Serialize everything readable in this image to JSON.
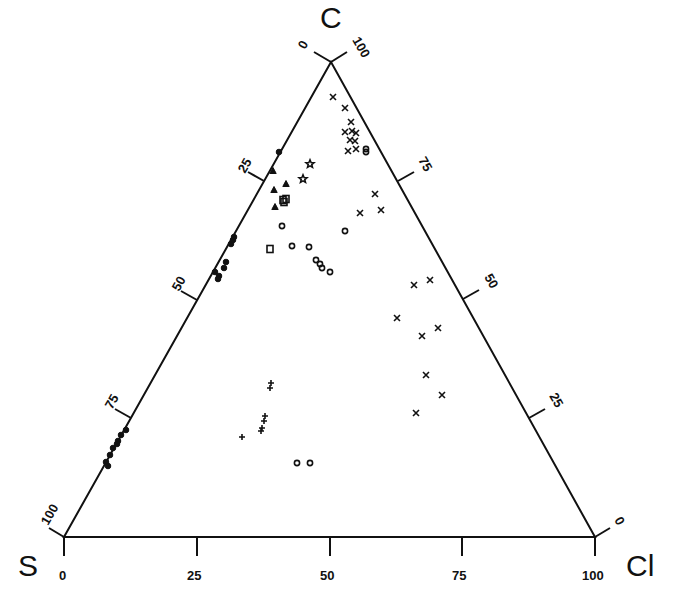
{
  "diagram": {
    "type": "ternary",
    "vertices": {
      "top": {
        "label": "C",
        "x": 331,
        "y": 62
      },
      "left": {
        "label": "S",
        "x": 64,
        "y": 537
      },
      "right": {
        "label": "Cl",
        "x": 595,
        "y": 537
      }
    },
    "axes": {
      "bottom": {
        "name": "Cl",
        "ticks": [
          "0",
          "25",
          "50",
          "75",
          "100"
        ]
      },
      "left": {
        "name": "C (left edge)",
        "ticks": [
          "100",
          "75",
          "50",
          "25",
          "0"
        ]
      },
      "right": {
        "name": "C (right edge)",
        "ticks": [
          "0",
          "25",
          "50",
          "75",
          "100"
        ]
      }
    },
    "color": "#111111"
  },
  "series": [
    {
      "name": "filled-circles",
      "marker": "dot",
      "points": [
        [
          279,
          152
        ],
        [
          233,
          240
        ],
        [
          234,
          237
        ],
        [
          231,
          244
        ],
        [
          215,
          272
        ],
        [
          219,
          276
        ],
        [
          224,
          268
        ],
        [
          226,
          262
        ],
        [
          218,
          279
        ],
        [
          126,
          430
        ],
        [
          121,
          435
        ],
        [
          118,
          441
        ],
        [
          113,
          448
        ],
        [
          110,
          455
        ],
        [
          106,
          462
        ],
        [
          108,
          466
        ],
        [
          117,
          444
        ]
      ]
    },
    {
      "name": "cross-x",
      "marker": "x",
      "points": [
        [
          333,
          97
        ],
        [
          345,
          108
        ],
        [
          351,
          122
        ],
        [
          345,
          132
        ],
        [
          352,
          131
        ],
        [
          356,
          133
        ],
        [
          350,
          140
        ],
        [
          355,
          141
        ],
        [
          356,
          149
        ],
        [
          348,
          151
        ],
        [
          375,
          194
        ],
        [
          360,
          213
        ],
        [
          381,
          210
        ],
        [
          414,
          285
        ],
        [
          430,
          280
        ],
        [
          397,
          318
        ],
        [
          422,
          336
        ],
        [
          438,
          328
        ],
        [
          426,
          375
        ],
        [
          442,
          395
        ],
        [
          416,
          413
        ]
      ]
    },
    {
      "name": "open-circles",
      "marker": "circle",
      "points": [
        [
          366,
          149
        ],
        [
          366,
          152
        ],
        [
          282,
          226
        ],
        [
          292,
          246
        ],
        [
          309,
          247
        ],
        [
          345,
          231
        ],
        [
          316,
          260
        ],
        [
          320,
          264
        ],
        [
          322,
          268
        ],
        [
          330,
          272
        ],
        [
          297,
          463
        ],
        [
          310,
          463
        ]
      ]
    },
    {
      "name": "triangles",
      "marker": "triangle",
      "points": [
        [
          273,
          171
        ],
        [
          286,
          184
        ],
        [
          274,
          190
        ],
        [
          275,
          207
        ]
      ]
    },
    {
      "name": "stars",
      "marker": "star",
      "points": [
        [
          310,
          164
        ],
        [
          303,
          179
        ]
      ]
    },
    {
      "name": "squares",
      "marker": "square",
      "points": [
        [
          283,
          200
        ],
        [
          286,
          199
        ],
        [
          284,
          202
        ],
        [
          270,
          249
        ]
      ]
    },
    {
      "name": "plus",
      "marker": "plus",
      "points": [
        [
          271,
          383
        ],
        [
          270,
          388
        ],
        [
          265,
          416
        ],
        [
          264,
          421
        ],
        [
          262,
          428
        ],
        [
          261,
          431
        ],
        [
          242,
          437
        ]
      ]
    }
  ]
}
